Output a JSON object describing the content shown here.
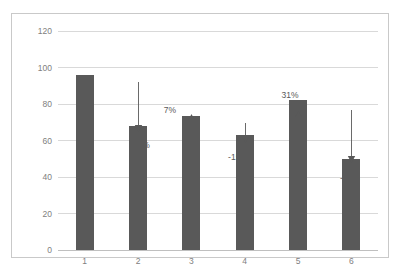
{
  "chart_data": {
    "type": "bar",
    "title": "",
    "xlabel": "",
    "ylabel": "",
    "categories": [
      "1",
      "2",
      "3",
      "4",
      "5",
      "6"
    ],
    "values": [
      96,
      68,
      73.5,
      63,
      82,
      50
    ],
    "series": [
      {
        "name": "Series 1",
        "values": [
          96,
          68,
          73.5,
          63,
          82,
          50
        ]
      }
    ],
    "ylim": [
      0,
      120
    ],
    "yticks": [
      0,
      20,
      40,
      60,
      80,
      100,
      120
    ],
    "ytick_labels": [
      "0",
      "20",
      "40",
      "60",
      "80",
      "100",
      "120"
    ],
    "grid": true,
    "legend": false,
    "legend_position": "none",
    "bar_color": "#595959",
    "gridline_color": "#d9d9d9",
    "tick_label_color": "#808080",
    "annotation_color": "#595959",
    "plot_border_color": "#c9c9c9",
    "background_color": "#ffffff",
    "annotations": [
      {
        "label": "-29%",
        "direction": "down",
        "from_category": "1",
        "to_category": "2",
        "value_change": -29
      },
      {
        "label": "7%",
        "direction": "up",
        "from_category": "2",
        "to_category": "3",
        "value_change": 7
      },
      {
        "label": "-15%",
        "direction": "down",
        "from_category": "3",
        "to_category": "4",
        "value_change": -15
      },
      {
        "label": "31%",
        "direction": "up",
        "from_category": "4",
        "to_category": "5",
        "value_change": 31
      },
      {
        "label": "-40%",
        "direction": "down",
        "from_category": "5",
        "to_category": "6",
        "value_change": -40
      }
    ]
  }
}
